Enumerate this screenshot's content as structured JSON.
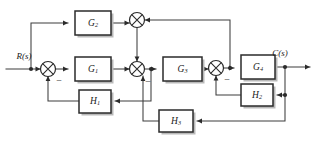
{
  "diagram": {
    "type": "control-system-block-diagram",
    "canvas": {
      "width": 315,
      "height": 141
    },
    "colors": {
      "background": "#ffffff",
      "wire": "#3d3d3d",
      "block_border": "#2b2b2b",
      "block_fill": "#ffffff",
      "block_shadow": "#b9b9b9",
      "text": "#1a1a1a"
    },
    "io": {
      "input": {
        "label": "R(s)",
        "name": "input-signal-label"
      },
      "output": {
        "label": "C(s)",
        "name": "output-signal-label"
      }
    },
    "blocks": [
      {
        "id": "G2",
        "base": "G",
        "sub": "2",
        "label": "G2",
        "x": 75,
        "y": 11,
        "w": 36,
        "h": 24,
        "role": "feedforward-path"
      },
      {
        "id": "G1",
        "base": "G",
        "sub": "1",
        "label": "G1",
        "x": 75,
        "y": 57,
        "w": 36,
        "h": 24,
        "role": "forward-path"
      },
      {
        "id": "G3",
        "base": "G",
        "sub": "3",
        "label": "G3",
        "x": 163,
        "y": 57,
        "w": 39,
        "h": 24,
        "role": "forward-path"
      },
      {
        "id": "G4",
        "base": "G",
        "sub": "4",
        "label": "G4",
        "x": 241,
        "y": 55,
        "w": 34,
        "h": 24,
        "role": "forward-path"
      },
      {
        "id": "H1",
        "base": "H",
        "sub": "1",
        "label": "H1",
        "x": 79,
        "y": 90,
        "w": 32,
        "h": 23,
        "role": "feedback-path"
      },
      {
        "id": "H2",
        "base": "H",
        "sub": "2",
        "label": "H2",
        "x": 241,
        "y": 84,
        "w": 32,
        "h": 22,
        "role": "feedback-path"
      },
      {
        "id": "H3",
        "base": "H",
        "sub": "3",
        "label": "H3",
        "x": 159,
        "y": 110,
        "w": 34,
        "h": 22,
        "role": "feedback-path"
      }
    ],
    "summing_junctions": [
      {
        "id": "S1",
        "cx": 48,
        "cy": 69,
        "r": 7.5,
        "sign": "−",
        "sign_x": 58,
        "sign_y": 83,
        "name": "summing-junction-1"
      },
      {
        "id": "S2",
        "cx": 137,
        "cy": 20,
        "r": 7.5,
        "sign": "",
        "sign_x": 0,
        "sign_y": 0,
        "name": "summing-junction-2"
      },
      {
        "id": "S3",
        "cx": 137,
        "cy": 69,
        "r": 7.5,
        "sign": "−",
        "sign_x": 147,
        "sign_y": 84,
        "name": "summing-junction-3"
      },
      {
        "id": "S4",
        "cx": 216,
        "cy": 68,
        "r": 7.5,
        "sign": "−",
        "sign_x": 226,
        "sign_y": 82,
        "name": "summing-junction-4"
      }
    ],
    "nodes": [
      {
        "id": "N_in",
        "x": 31,
        "y": 69,
        "name": "node-input-branch"
      },
      {
        "id": "N_g3",
        "x": 151,
        "y": 69,
        "name": "node-after-junction-3"
      },
      {
        "id": "N_g4",
        "x": 230,
        "y": 68,
        "name": "node-before-g4"
      },
      {
        "id": "N_out",
        "x": 285,
        "y": 67,
        "name": "node-output-branch"
      },
      {
        "id": "N_h2",
        "x": 285,
        "y": 95,
        "name": "node-h2-feedback"
      }
    ],
    "connections": [
      {
        "from": "R(s)",
        "to": "S1",
        "name": "wire-input-to-sum1"
      },
      {
        "from": "N_in",
        "to": "G2",
        "name": "wire-input-to-g2"
      },
      {
        "from": "G2",
        "to": "S2",
        "name": "wire-g2-to-sum2"
      },
      {
        "from": "S1",
        "to": "G1",
        "name": "wire-sum1-to-g1"
      },
      {
        "from": "G1",
        "to": "S3",
        "name": "wire-g1-to-sum3"
      },
      {
        "from": "S2",
        "to": "S3",
        "name": "wire-sum2-to-sum3"
      },
      {
        "from": "S3",
        "to": "G3",
        "name": "wire-sum3-to-g3"
      },
      {
        "from": "G3",
        "to": "S4",
        "name": "wire-g3-to-sum4"
      },
      {
        "from": "S4",
        "to": "G4",
        "name": "wire-sum4-to-g4"
      },
      {
        "from": "G4",
        "to": "C(s)",
        "name": "wire-g4-to-output"
      },
      {
        "from": "N_g3",
        "to": "H1",
        "name": "wire-to-h1"
      },
      {
        "from": "H1",
        "to": "S1",
        "name": "wire-h1-to-sum1"
      },
      {
        "from": "N_h2",
        "to": "H2",
        "name": "wire-to-h2"
      },
      {
        "from": "H2",
        "to": "S4",
        "name": "wire-h2-to-sum4"
      },
      {
        "from": "N_out",
        "to": "H3",
        "name": "wire-to-h3"
      },
      {
        "from": "H3",
        "to": "S3",
        "name": "wire-h3-to-sum3"
      },
      {
        "from": "N_g4",
        "to": "S2",
        "name": "wire-feedback-to-sum2"
      }
    ]
  }
}
